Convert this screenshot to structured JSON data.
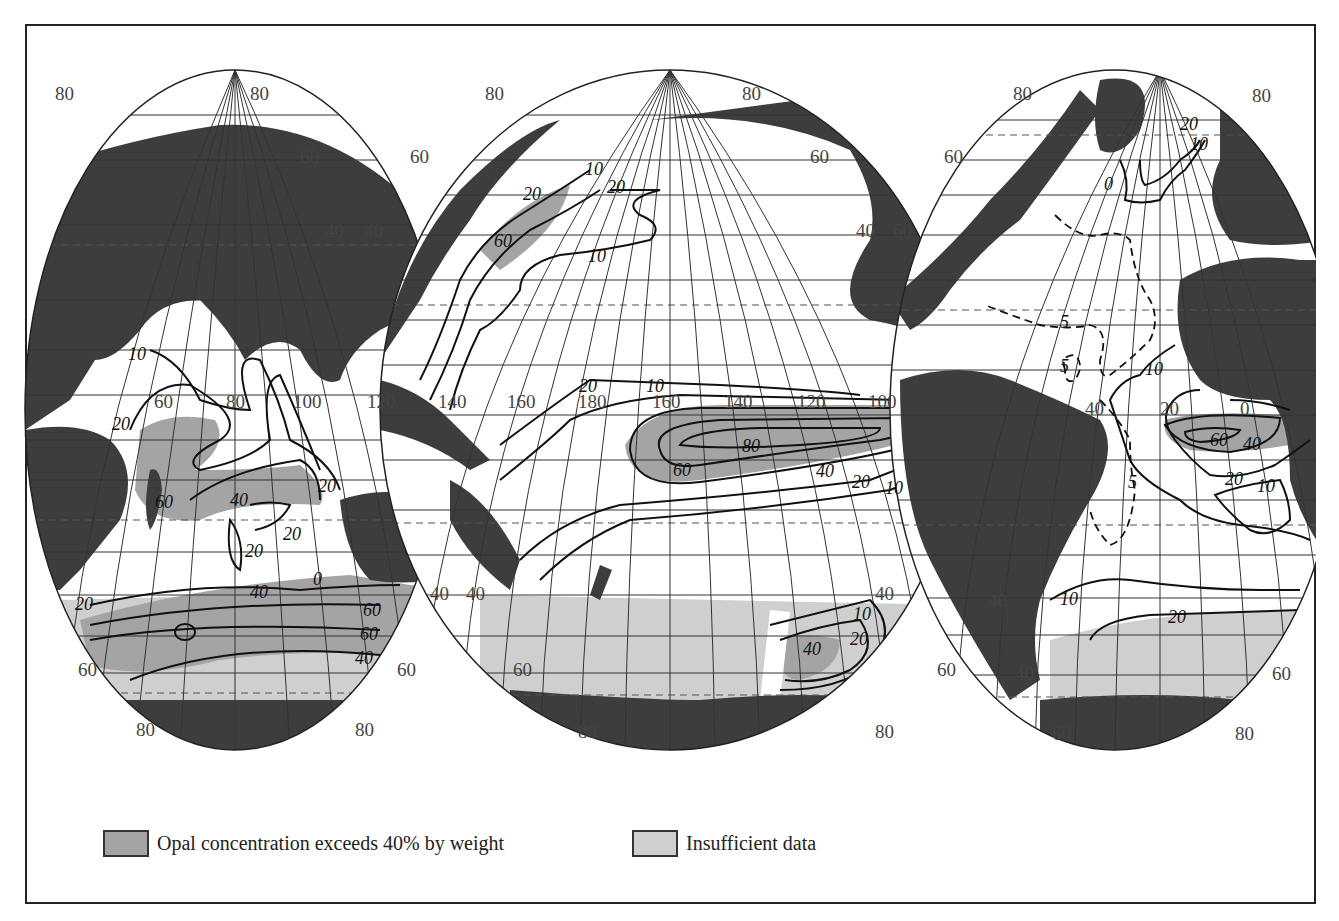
{
  "map": {
    "title": "Opal (biogenic silica) concentration in surface sediments",
    "projection": "interrupted ellipsoidal (three lobes)",
    "lobes": [
      {
        "name": "Indian Ocean",
        "lat_labels": [
          "80",
          "80",
          "60",
          "40",
          "40",
          "60",
          "60",
          "80",
          "80"
        ],
        "lon_labels": [
          "60",
          "80",
          "100"
        ],
        "contour_labels": [
          "10",
          "20",
          "20",
          "60",
          "40",
          "20",
          "20",
          "0",
          "20",
          "40",
          "60",
          "60",
          "40"
        ]
      },
      {
        "name": "Pacific Ocean",
        "lat_labels": [
          "80",
          "80",
          "60",
          "60",
          "40",
          "40",
          "40",
          "40",
          "60",
          "60",
          "80",
          "80"
        ],
        "lon_labels": [
          "120",
          "140",
          "160",
          "180",
          "160",
          "140",
          "120",
          "100"
        ],
        "contour_labels": [
          "10",
          "20",
          "60",
          "20",
          "10",
          "20",
          "10",
          "20",
          "10",
          "20",
          "80",
          "60",
          "40",
          "20",
          "10",
          "10",
          "0",
          "10",
          "20",
          "40"
        ]
      },
      {
        "name": "Atlantic Ocean",
        "lat_labels": [
          "80",
          "80",
          "60",
          "60",
          "40",
          "40",
          "60",
          "60",
          "80",
          "80"
        ],
        "lon_labels": [
          "40",
          "20",
          "0"
        ],
        "contour_labels": [
          "20",
          "10",
          "0",
          "5",
          "5",
          "5",
          "10",
          "60",
          "40",
          "20",
          "10",
          "10",
          "20"
        ]
      }
    ]
  },
  "legend": {
    "items": [
      {
        "label": "Opal concentration exceeds 40% by weight",
        "color": "#a4a4a4"
      },
      {
        "label": "Insufficient data",
        "color": "#cfcfcf"
      }
    ]
  },
  "colors": {
    "land": "#3d3d3d",
    "opal_gt_40": "#a4a4a4",
    "insufficient_data": "#cfcfcf",
    "ocean": "#ffffff"
  }
}
